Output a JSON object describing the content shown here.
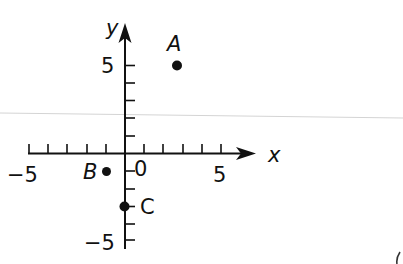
{
  "diagram": {
    "type": "coordinate-plane",
    "axes": {
      "x": {
        "label": "x",
        "min": -5,
        "max": 5,
        "tick_step": 1,
        "labeled_ticks": [
          "-5",
          "0",
          "5"
        ]
      },
      "y": {
        "label": "y",
        "min": -5,
        "max": 5,
        "tick_step": 1,
        "labeled_ticks": [
          "5",
          "-5"
        ]
      }
    },
    "tick_labels": {
      "x_neg5": "−5",
      "origin": "0",
      "x_pos5": "5",
      "y_pos5": "5",
      "y_neg5": "−5"
    },
    "points": [
      {
        "name": "A",
        "x": 3,
        "y": 5
      },
      {
        "name": "B",
        "x": -1,
        "y": -1
      },
      {
        "name": "C",
        "x": 0,
        "y": -3
      }
    ],
    "colors": {
      "ink": "#111111",
      "scan_line": "#cfcfcf",
      "background": "#ffffff"
    }
  }
}
